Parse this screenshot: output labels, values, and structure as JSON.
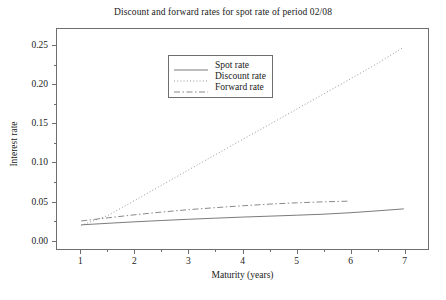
{
  "chart_data": {
    "type": "line",
    "title": "Discount and forward rates for spot rate of period 02/08",
    "xlabel": "Maturity (years)",
    "ylabel": "Interest rate",
    "xlim": [
      0.55,
      7.45
    ],
    "ylim": [
      -0.012,
      0.272
    ],
    "grid": false,
    "legend_position": "upper center",
    "xticks": [
      "1",
      "2",
      "3",
      "4",
      "5",
      "6",
      "7"
    ],
    "xtick_values": [
      1,
      2,
      3,
      4,
      5,
      6,
      7
    ],
    "yticks": [
      "0.00",
      "0.05",
      "0.10",
      "0.15",
      "0.20",
      "0.25"
    ],
    "ytick_values": [
      0.0,
      0.05,
      0.1,
      0.15,
      0.2,
      0.25
    ],
    "series": [
      {
        "name": "Spot rate",
        "style": "solid",
        "color": "#6b6b6b",
        "x": [
          1,
          1.5,
          2,
          2.5,
          3,
          3.5,
          4,
          4.5,
          5,
          5.5,
          6,
          6.5,
          7
        ],
        "values": [
          0.0192,
          0.0212,
          0.0231,
          0.0248,
          0.0264,
          0.0278,
          0.0292,
          0.0304,
          0.0316,
          0.0329,
          0.0348,
          0.0372,
          0.0398
        ]
      },
      {
        "name": "Discount rate",
        "style": "dotted",
        "color": "#8a8a8a",
        "x": [
          1,
          1.5,
          2,
          2.5,
          3,
          3.5,
          4,
          4.5,
          5,
          5.5,
          6,
          6.5,
          7
        ],
        "values": [
          0.0185,
          0.0315,
          0.0508,
          0.0705,
          0.0903,
          0.1098,
          0.1293,
          0.1487,
          0.1683,
          0.1878,
          0.2073,
          0.2272,
          0.2487
        ]
      },
      {
        "name": "Forward rate",
        "style": "dashdot",
        "color": "#7a7a7a",
        "x": [
          1,
          1.5,
          2,
          2.5,
          3,
          3.5,
          4,
          4.5,
          5,
          5.5,
          6
        ],
        "values": [
          0.0242,
          0.0283,
          0.0322,
          0.0357,
          0.0388,
          0.0414,
          0.0438,
          0.0459,
          0.0476,
          0.0489,
          0.0498
        ]
      }
    ]
  },
  "legend": {
    "items": [
      {
        "label": "Spot rate"
      },
      {
        "label": "Discount rate"
      },
      {
        "label": "Forward rate"
      }
    ]
  }
}
